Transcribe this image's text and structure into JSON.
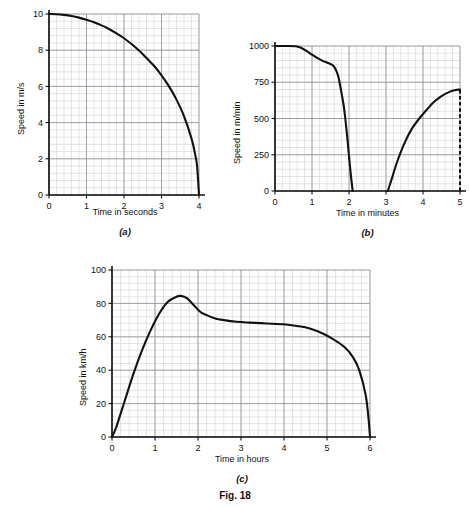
{
  "figure": {
    "caption": "Fig. 18",
    "panels": [
      {
        "key": "a",
        "subcaption": "(a)",
        "xlabel": "Time in seconds",
        "ylabel": "Speed in m/s"
      },
      {
        "key": "b",
        "subcaption": "(b)",
        "xlabel": "Time in minutes",
        "ylabel": "Speed in m/min"
      },
      {
        "key": "c",
        "subcaption": "(c)",
        "xlabel": "Time in hours",
        "ylabel": "Speed in km/h"
      }
    ]
  },
  "colors": {
    "curve": "#111111",
    "axis": "#111111",
    "grid_minor": "#c9c9cf",
    "grid_major": "#8f8f99",
    "background": "#ffffff"
  },
  "chart_data": [
    {
      "id": "panel-a",
      "type": "line",
      "title": "(a)",
      "xlabel": "Time in seconds",
      "ylabel": "Speed in m/s",
      "xlim": [
        0,
        4
      ],
      "ylim": [
        0,
        10
      ],
      "xticks": [
        0,
        1,
        2,
        3,
        4
      ],
      "xtick_labels": [
        "0",
        "1",
        "2",
        "3",
        "4"
      ],
      "yticks": [
        0,
        2,
        4,
        6,
        8,
        10
      ],
      "ytick_labels": [
        "0",
        "2",
        "4",
        "6",
        "8",
        "10"
      ],
      "grid": true,
      "grid_minor_per_major": 5,
      "legend": "none",
      "series": [
        {
          "name": "speed",
          "x": [
            0.0,
            0.2,
            0.4,
            0.6,
            0.8,
            1.0,
            1.2,
            1.4,
            1.6,
            1.8,
            2.0,
            2.2,
            2.4,
            2.6,
            2.8,
            3.0,
            3.2,
            3.4,
            3.6,
            3.8,
            3.9,
            3.95,
            4.0
          ],
          "y": [
            10.0,
            9.99,
            9.95,
            9.89,
            9.8,
            9.68,
            9.54,
            9.37,
            9.17,
            8.93,
            8.66,
            8.34,
            7.98,
            7.57,
            7.14,
            6.61,
            6.0,
            5.27,
            4.36,
            3.12,
            2.22,
            1.57,
            0.0
          ]
        }
      ]
    },
    {
      "id": "panel-b",
      "type": "line",
      "title": "(b)",
      "xlabel": "Time in minutes",
      "ylabel": "Speed in m/min",
      "xlim": [
        0,
        5
      ],
      "ylim": [
        0,
        1000
      ],
      "xticks": [
        0,
        1,
        2,
        3,
        4,
        5
      ],
      "xtick_labels": [
        "0",
        "1",
        "2",
        "3",
        "4",
        "5"
      ],
      "yticks": [
        0,
        250,
        500,
        750,
        1000
      ],
      "ytick_labels": [
        "0",
        "250",
        "500",
        "750",
        "1000"
      ],
      "grid": true,
      "grid_minor_per_major": 5,
      "legend": "none",
      "annotations": [
        {
          "type": "dashed-vline",
          "x": 5,
          "y0": 0,
          "y1": 700
        }
      ],
      "series": [
        {
          "name": "speed-segment-1",
          "x": [
            0.0,
            0.3,
            0.55,
            0.7,
            0.85,
            1.0,
            1.15,
            1.3,
            1.4,
            1.5,
            1.6,
            1.7,
            1.78,
            1.85,
            1.9,
            1.95,
            2.0,
            2.05,
            2.1
          ],
          "y": [
            1000,
            1000,
            998,
            988,
            966,
            940,
            916,
            896,
            886,
            876,
            856,
            800,
            700,
            600,
            500,
            380,
            240,
            110,
            0
          ]
        },
        {
          "name": "speed-segment-2",
          "x": [
            3.05,
            3.15,
            3.3,
            3.5,
            3.7,
            3.9,
            4.1,
            4.3,
            4.5,
            4.7,
            4.85,
            5.0
          ],
          "y": [
            0,
            80,
            200,
            330,
            430,
            500,
            560,
            615,
            655,
            682,
            695,
            700
          ]
        }
      ]
    },
    {
      "id": "panel-c",
      "type": "line",
      "title": "(c)",
      "xlabel": "Time in hours",
      "ylabel": "Speed in km/h",
      "xlim": [
        0,
        6
      ],
      "ylim": [
        0,
        100
      ],
      "xticks": [
        0,
        1,
        2,
        3,
        4,
        5,
        6
      ],
      "xtick_labels": [
        "0",
        "1",
        "2",
        "3",
        "4",
        "5",
        "6"
      ],
      "yticks": [
        0,
        20,
        40,
        60,
        80,
        100
      ],
      "ytick_labels": [
        "0",
        "20",
        "40",
        "60",
        "80",
        "100"
      ],
      "grid": true,
      "grid_minor_per_major": 5,
      "legend": "none",
      "series": [
        {
          "name": "speed",
          "x": [
            0.0,
            0.1,
            0.3,
            0.5,
            0.7,
            0.9,
            1.1,
            1.3,
            1.5,
            1.6,
            1.75,
            1.9,
            2.05,
            2.2,
            2.4,
            2.6,
            2.9,
            3.2,
            3.6,
            4.0,
            4.3,
            4.6,
            4.9,
            5.15,
            5.4,
            5.6,
            5.75,
            5.9,
            5.97,
            6.0
          ],
          "y": [
            0,
            6,
            22,
            38,
            52,
            64,
            74,
            81,
            84,
            84.5,
            83,
            79,
            75,
            73,
            71,
            70,
            69,
            68.5,
            68,
            67.5,
            66.5,
            65,
            62,
            58.5,
            54,
            48,
            40,
            25,
            10,
            0
          ]
        }
      ]
    }
  ]
}
